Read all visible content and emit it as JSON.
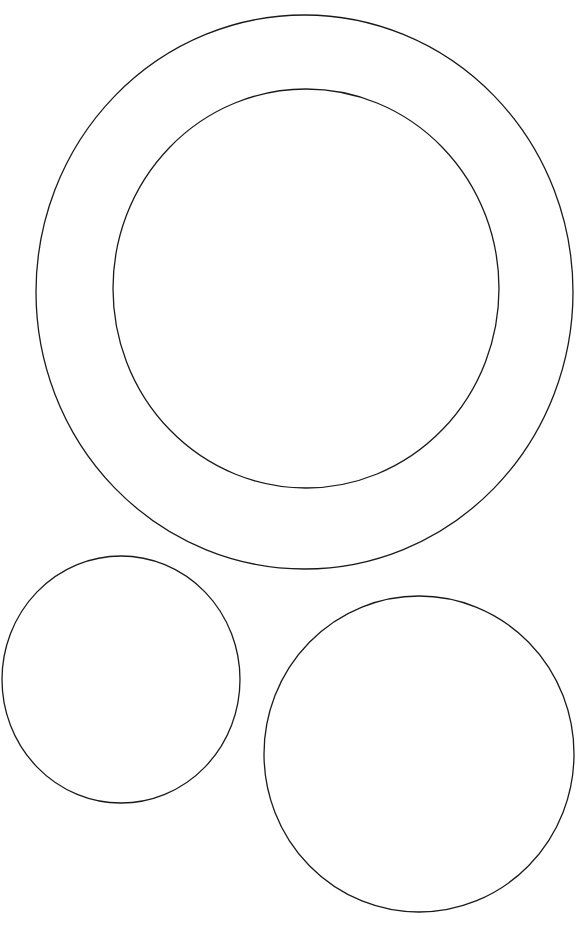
{
  "canvas": {
    "width": 584,
    "height": 925,
    "background": "#ffffff",
    "stroke_color": "#1a1a1a"
  },
  "shapes": [
    {
      "name": "outer-ring-ellipse",
      "cx": 304.5,
      "cy": 292,
      "rx": 268.5,
      "ry": 277
    },
    {
      "name": "inner-ring-ellipse",
      "cx": 306,
      "cy": 288.5,
      "rx": 193,
      "ry": 199.5
    },
    {
      "name": "small-circle-bottom-left",
      "cx": 121,
      "cy": 679.5,
      "rx": 119,
      "ry": 123.5
    },
    {
      "name": "medium-circle-bottom-right",
      "cx": 419,
      "cy": 754,
      "rx": 155,
      "ry": 158
    }
  ]
}
